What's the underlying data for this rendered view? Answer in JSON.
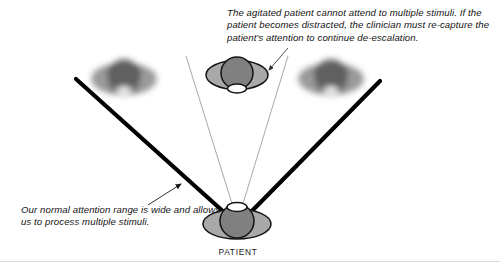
{
  "figure": {
    "captions": {
      "agitated": "The agitated patient cannot attend to multiple stimuli. If the patient becomes distracted, the clinician must re-capture the patient's attention to continue de-escalation.",
      "normal": "Our normal attention range is wide and allows us to process multiple stimuli."
    },
    "labels": {
      "patient": "PATIENT"
    },
    "figures": [
      {
        "name": "stimulus-left",
        "state": "blurred",
        "x": 124,
        "y": 78
      },
      {
        "name": "stimulus-center",
        "state": "focused",
        "x": 237,
        "y": 78
      },
      {
        "name": "stimulus-right",
        "state": "blurred",
        "x": 330,
        "y": 78
      },
      {
        "name": "patient-figure",
        "state": "focused",
        "x": 237,
        "y": 218
      }
    ],
    "colors": {
      "attention_line": "#000000",
      "focus_line": "#9a9a9a",
      "leader_line": "#8c8c8c",
      "shoulders": "#a9a9a9",
      "head": "#808080",
      "neck": "#ffffff",
      "outline": "#1a1a1a",
      "text": "#121212",
      "bottom_rule": "#d8d8d8",
      "background": "#ffffff"
    }
  }
}
